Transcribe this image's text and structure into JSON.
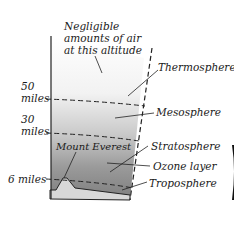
{
  "diagram": {
    "note": [
      "Negligible",
      "amounts of air",
      "at this altitude"
    ],
    "altitude_labels": {
      "fifty": [
        "50",
        "miles"
      ],
      "thirty": [
        "30",
        "miles"
      ],
      "six": "6 miles"
    },
    "layers": {
      "thermosphere": "Thermosphere",
      "mesosphere": "Mesosphere",
      "stratosphere": "Stratosphere",
      "ozone": "Ozone layer",
      "troposphere": "Troposphere"
    },
    "landmark": "Mount Everest",
    "colors": {
      "dark": "#7a7a7a",
      "mid": "#a8a8a8",
      "light": "#e8e8e8",
      "ground": "#d6d6d6"
    }
  }
}
